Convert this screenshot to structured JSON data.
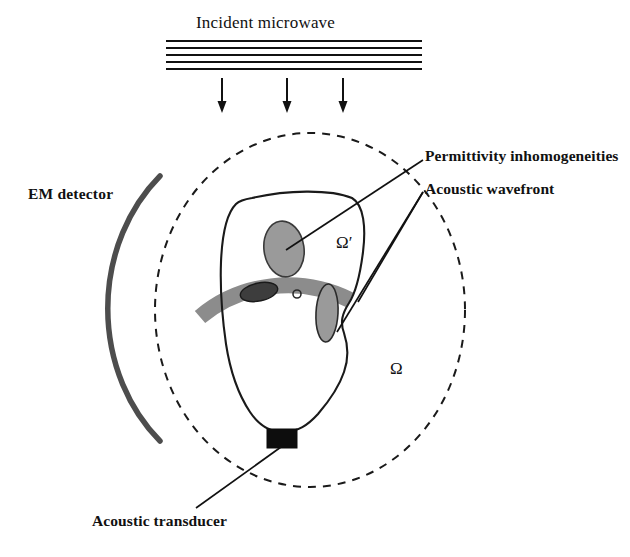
{
  "figure": {
    "width": 630,
    "height": 557,
    "background_color": "#ffffff"
  },
  "labels": {
    "incident_microwave": "Incident microwave",
    "em_detector": "EM detector",
    "permittivity_inhomogeneities": "Permittivity inhomogeneities",
    "acoustic_wavefront": "Acoustic wavefront",
    "acoustic_transducer": "Acoustic transducer",
    "domain_outer": "Ω",
    "domain_inner": "Ω′"
  },
  "colors": {
    "ink": "#111111",
    "line": "#1a1a1a",
    "wavefront_band": "#8c8c8c",
    "inhomogeneity_fill": "#9a9a9a",
    "inhomogeneity_dark_fill": "#3d3d3d",
    "detector_arc": "#4d4d4d",
    "transducer_fill": "#0d0d0d",
    "dashed_boundary": "#1a1a1a"
  },
  "geometry": {
    "outer_domain_circle": {
      "cx": 310,
      "cy": 310,
      "rx": 155,
      "ry": 177,
      "style": "dashed"
    },
    "em_detector_arc": {
      "start": [
        160,
        176
      ],
      "end": [
        160,
        441
      ],
      "thickness": 5
    },
    "microwave_source": {
      "line_count": 5,
      "x_start": 166,
      "x_end": 422,
      "y_start": 41,
      "y_spacing": 7
    },
    "microwave_arrows": [
      {
        "x": 222,
        "y_start": 78,
        "y_end": 110
      },
      {
        "x": 287,
        "y_start": 78,
        "y_end": 110
      },
      {
        "x": 343,
        "y_start": 78,
        "y_end": 110
      }
    ],
    "transducer_rect": {
      "x": 267,
      "y": 429,
      "width": 30,
      "height": 19
    },
    "inhomogeneities": [
      {
        "name": "upper-ellipse",
        "cx": 284,
        "cy": 249,
        "rx": 20,
        "ry": 28,
        "rotation": -8,
        "fill": "inhomogeneity_fill"
      },
      {
        "name": "band-left-ellipse",
        "cx": 259,
        "cy": 292,
        "rx": 19,
        "ry": 9,
        "rotation": -12,
        "fill": "inhomogeneity_dark_fill"
      },
      {
        "name": "band-small-circle",
        "cx": 297,
        "cy": 294,
        "rx": 4,
        "ry": 4,
        "rotation": 0,
        "fill": "none"
      },
      {
        "name": "band-right-ellipse",
        "cx": 327,
        "cy": 313,
        "rx": 11,
        "ry": 29,
        "rotation": 3,
        "fill": "inhomogeneity_fill"
      }
    ],
    "leader_lines": [
      {
        "name": "permittivity-leader",
        "from": [
          423,
          160
        ],
        "to": [
          286,
          250
        ]
      },
      {
        "name": "acoustic-wavefront-leader",
        "from": [
          423,
          192
        ],
        "to": [
          337,
          330
        ]
      },
      {
        "name": "acoustic-wavefront-leader-2",
        "from": [
          423,
          192
        ],
        "to": [
          357,
          303
        ]
      },
      {
        "name": "transducer-leader",
        "from": [
          196,
          508
        ],
        "to": [
          281,
          447
        ]
      }
    ]
  }
}
